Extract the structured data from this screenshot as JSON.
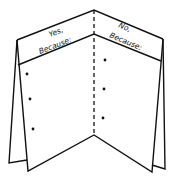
{
  "diagram": {
    "type": "foldable-organizer",
    "left_panel": {
      "heading_line1": "Yes,",
      "heading_line2": "Because:",
      "bullets": 3
    },
    "right_panel": {
      "heading_line1": "No,",
      "heading_line2": "Because:",
      "bullets": 3
    },
    "colors": {
      "stroke": "#111111",
      "background": "#ffffff"
    }
  }
}
